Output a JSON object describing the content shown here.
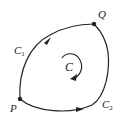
{
  "diagram": {
    "type": "closed-curve-path-diagram",
    "stroke_color": "#222222",
    "points": [
      {
        "id": "P",
        "label": "P"
      },
      {
        "id": "Q",
        "label": "Q"
      }
    ],
    "curves": [
      {
        "id": "C1",
        "label_main": "C",
        "label_sub": "1",
        "from": "P",
        "to": "Q",
        "direction": "P to Q (upper-left arc)"
      },
      {
        "id": "C2",
        "label_main": "C",
        "label_sub": "2",
        "from": "P",
        "to": "Q",
        "direction": "P to Q (lower-right arc)"
      }
    ],
    "closed_curve": {
      "label": "C",
      "orientation": "clockwise"
    }
  }
}
